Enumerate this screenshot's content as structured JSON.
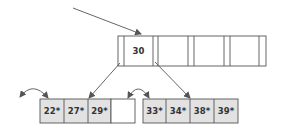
{
  "diagram": {
    "type": "B+ tree",
    "colors": {
      "stroke": "#555555",
      "leaf_fill": "#e2e2e2",
      "empty_fill": "#ffffff",
      "arrow": "#555555"
    },
    "root": {
      "keys": [
        "30",
        "",
        "",
        ""
      ]
    },
    "leaves": [
      {
        "entries": [
          "22*",
          "27*",
          "29*",
          ""
        ]
      },
      {
        "entries": [
          "33*",
          "34*",
          "38*",
          "39*"
        ]
      }
    ]
  }
}
